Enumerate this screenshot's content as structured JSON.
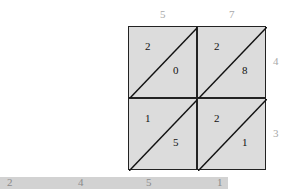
{
  "diagram": {
    "type": "lattice-multiplication",
    "top_digits": [
      "5",
      "7"
    ],
    "right_digits": [
      "4",
      "3"
    ],
    "cells": [
      {
        "row": 0,
        "col": 0,
        "upper": "2",
        "lower": "0"
      },
      {
        "row": 0,
        "col": 1,
        "upper": "2",
        "lower": "8"
      },
      {
        "row": 1,
        "col": 0,
        "upper": "1",
        "lower": "5"
      },
      {
        "row": 1,
        "col": 1,
        "upper": "2",
        "lower": "1"
      }
    ],
    "result_digits": [
      "2",
      "4",
      "5",
      "1"
    ],
    "colors": {
      "cell_fill": "#dcdcdc",
      "grid_line": "#222222",
      "label": "#a8a8a8",
      "result_bar": "#d2d2d2"
    }
  }
}
